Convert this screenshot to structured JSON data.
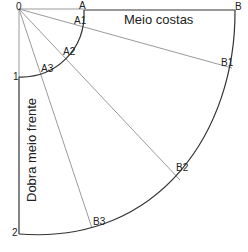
{
  "diagram": {
    "title_top": "Meio costas",
    "title_side": "Dobra meio frente",
    "points": {
      "origin": "0",
      "a": "A",
      "a1": "A1",
      "a2": "A2",
      "a3": "A3",
      "p1": "1",
      "b": "B",
      "b1": "B1",
      "b2": "B2",
      "b3": "B3",
      "p2": "2"
    },
    "colors": {
      "outline": "#333333",
      "radial": "#999999",
      "text": "#222222"
    }
  }
}
